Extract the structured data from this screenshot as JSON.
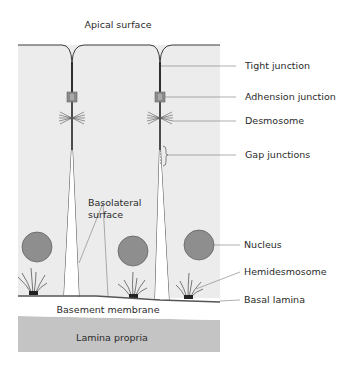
{
  "diagram": {
    "title": "Apical surface",
    "labels": {
      "tight_junction": "Tight junction",
      "adhesion_junction": "Adhension junction",
      "desmosome": "Desmosome",
      "gap_junctions": "Gap junctions",
      "nucleus": "Nucleus",
      "hemidesmosome": "Hemidesmosome",
      "basal_lamina": "Basal lamina",
      "basolateral_line1": "Basolateral",
      "basolateral_line2": "surface",
      "basement_membrane": "Basement membrane",
      "lamina_propria": "Lamina propria"
    },
    "colors": {
      "cell_fill": "#ececec",
      "membrane": "#3a3a3a",
      "nucleus": "#8e8e8e",
      "nucleus_stroke": "#5a5a5a",
      "lamina_propria": "#c4c4c4",
      "leader_line": "#7a7a7a",
      "basal_lamina": "#555555"
    }
  }
}
